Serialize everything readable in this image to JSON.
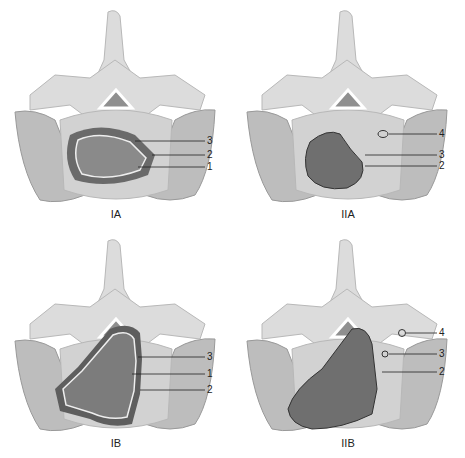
{
  "figure": {
    "panels": [
      {
        "id": "IA",
        "label": "IA",
        "callouts": [
          "3",
          "2",
          "1"
        ]
      },
      {
        "id": "IIA",
        "label": "IIA",
        "callouts": [
          "4",
          "3",
          "2"
        ]
      },
      {
        "id": "IB",
        "label": "IB",
        "callouts": [
          "3",
          "1",
          "2"
        ]
      },
      {
        "id": "IIB",
        "label": "IIB",
        "callouts": [
          "4",
          "3",
          "2"
        ]
      }
    ]
  },
  "colors": {
    "bone": "#dcdcdc",
    "bone_shade": "#b8b8b8",
    "canal": "#8f8f8f",
    "muscle": "#bdbdbd",
    "disc": "#d2d2d2",
    "tumor": "#7c7c7c",
    "capsule": "#5e5e5e"
  }
}
